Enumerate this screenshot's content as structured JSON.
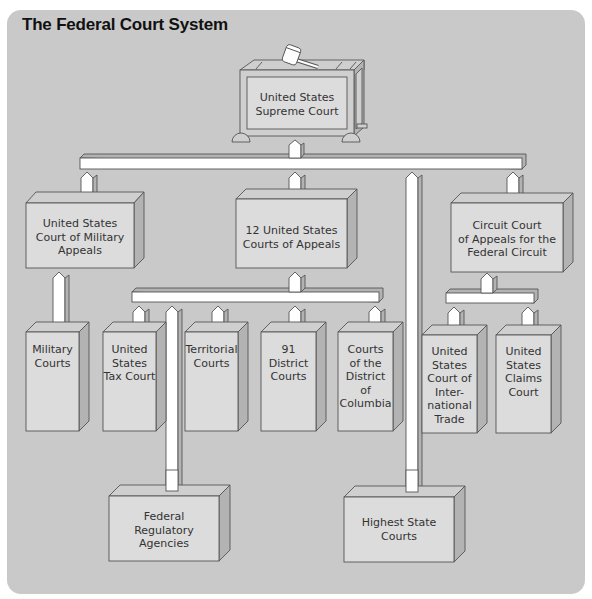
{
  "title": "The Federal Court System",
  "colors": {
    "background": "#c9c9c9",
    "box_face_light": "#dcdcdc",
    "box_face_dark": "#b5b5b5",
    "connector": "#ffffff",
    "outline": "#555555",
    "text": "#333333"
  },
  "nodes": {
    "supreme": {
      "label_1": "United States",
      "label_2": "Supreme Court"
    },
    "military_appeals": {
      "label_1": "United States",
      "label_2": "Court of Military",
      "label_3": "Appeals"
    },
    "courts_of_appeals": {
      "label_1": "12 United States",
      "label_2": "Courts of Appeals"
    },
    "federal_circuit": {
      "label_1": "Circuit Court",
      "label_2": "of Appeals for the",
      "label_3": "Federal Circuit"
    },
    "military_courts": {
      "label_1": "Military",
      "label_2": "Courts"
    },
    "tax_court": {
      "label_1": "United",
      "label_2": "States",
      "label_3": "Tax Court"
    },
    "territorial": {
      "label_1": "Territorial",
      "label_2": "Courts"
    },
    "district": {
      "label_1": "91",
      "label_2": "District",
      "label_3": "Courts"
    },
    "dc_courts": {
      "label_1": "Courts",
      "label_2": "of the",
      "label_3": "District",
      "label_4": "of",
      "label_5": "Columbia"
    },
    "intl_trade": {
      "label_1": "United",
      "label_2": "States",
      "label_3": "Court of",
      "label_4": "Inter-",
      "label_5": "national",
      "label_6": "Trade"
    },
    "claims": {
      "label_1": "United",
      "label_2": "States",
      "label_3": "Claims",
      "label_4": "Court"
    },
    "regulatory": {
      "label_1": "Federal",
      "label_2": "Regulatory",
      "label_3": "Agencies"
    },
    "state": {
      "label_1": "Highest State",
      "label_2": "Courts"
    }
  },
  "edges": [
    [
      "supreme",
      "military_appeals"
    ],
    [
      "supreme",
      "courts_of_appeals"
    ],
    [
      "supreme",
      "state"
    ],
    [
      "supreme",
      "federal_circuit"
    ],
    [
      "military_appeals",
      "military_courts"
    ],
    [
      "courts_of_appeals",
      "tax_court"
    ],
    [
      "courts_of_appeals",
      "regulatory"
    ],
    [
      "courts_of_appeals",
      "territorial"
    ],
    [
      "courts_of_appeals",
      "district"
    ],
    [
      "courts_of_appeals",
      "dc_courts"
    ],
    [
      "federal_circuit",
      "intl_trade"
    ],
    [
      "federal_circuit",
      "claims"
    ]
  ]
}
